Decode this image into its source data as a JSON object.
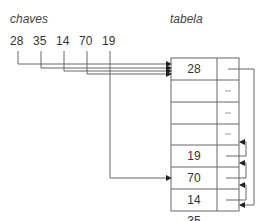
{
  "labels": {
    "keys_title": "chaves",
    "table_title": "tabela"
  },
  "keys": [
    {
      "value": "28",
      "x": 10
    },
    {
      "value": "35",
      "x": 33
    },
    {
      "value": "14",
      "x": 56
    },
    {
      "value": "70",
      "x": 79
    },
    {
      "value": "19",
      "x": 102
    }
  ],
  "table": {
    "rows": [
      {
        "key": "28",
        "link": "→ 19"
      },
      {
        "key": "",
        "link": "–"
      },
      {
        "key": "",
        "link": "–"
      },
      {
        "key": "",
        "link": ""
      },
      {
        "key": "19",
        "link": "–"
      },
      {
        "key": "70",
        "link": ""
      },
      {
        "key": "14",
        "link": ""
      },
      {
        "key": "35",
        "link": ""
      }
    ]
  },
  "colors": {
    "line": "#555555",
    "text": "#333333"
  }
}
